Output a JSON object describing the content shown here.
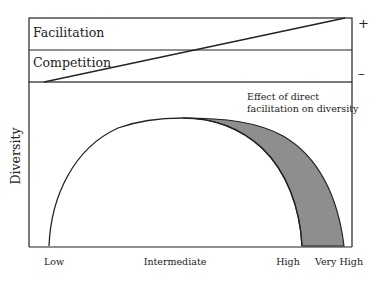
{
  "gradient_panel": {
    "top_band_label": "Facilitation",
    "bottom_band_label": "Competition",
    "sign_plus": "+",
    "sign_minus": "–"
  },
  "main_plot": {
    "y_axis_label": "Diversity",
    "x_tick_labels": [
      "Low",
      "Intermediate",
      "High",
      "Very High"
    ],
    "annotation_line1": "Effect of direct",
    "annotation_line2": "facilitation on diversity",
    "shaded_region_color": "#8e8e8e"
  }
}
